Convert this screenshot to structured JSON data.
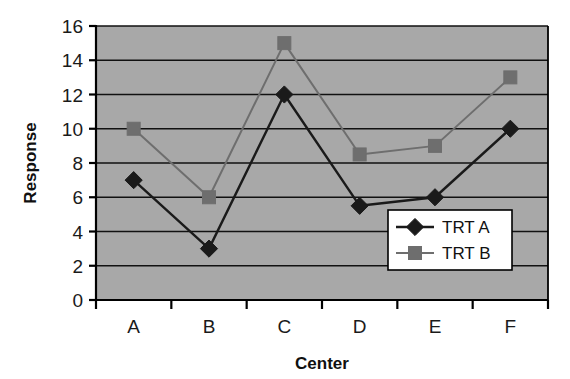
{
  "chart_data": {
    "type": "line",
    "title": "",
    "xlabel": "Center",
    "ylabel": "Response",
    "categories": [
      "A",
      "B",
      "C",
      "D",
      "E",
      "F"
    ],
    "series": [
      {
        "name": "TRT A",
        "marker": "diamond",
        "color": "#1a1a1a",
        "values": [
          7,
          3,
          12,
          5.5,
          6,
          10
        ]
      },
      {
        "name": "TRT B",
        "marker": "square",
        "color": "#6e6e6e",
        "values": [
          10,
          6,
          15,
          8.5,
          9,
          13
        ]
      }
    ],
    "ylim": [
      0,
      16
    ],
    "ytick_step": 2,
    "yticks": [
      "0",
      "2",
      "4",
      "6",
      "8",
      "10",
      "12",
      "14",
      "16"
    ],
    "grid": true,
    "grid_axis": "y",
    "legend_position": "bottom-right-inside",
    "plot_background": "#a8a8a8",
    "gridline_color": "#111111",
    "axis_color": "#000000"
  },
  "legend": {
    "entries": [
      {
        "label": "TRT A"
      },
      {
        "label": "TRT B"
      }
    ]
  },
  "axes": {
    "y_title": "Response",
    "x_title": "Center"
  }
}
